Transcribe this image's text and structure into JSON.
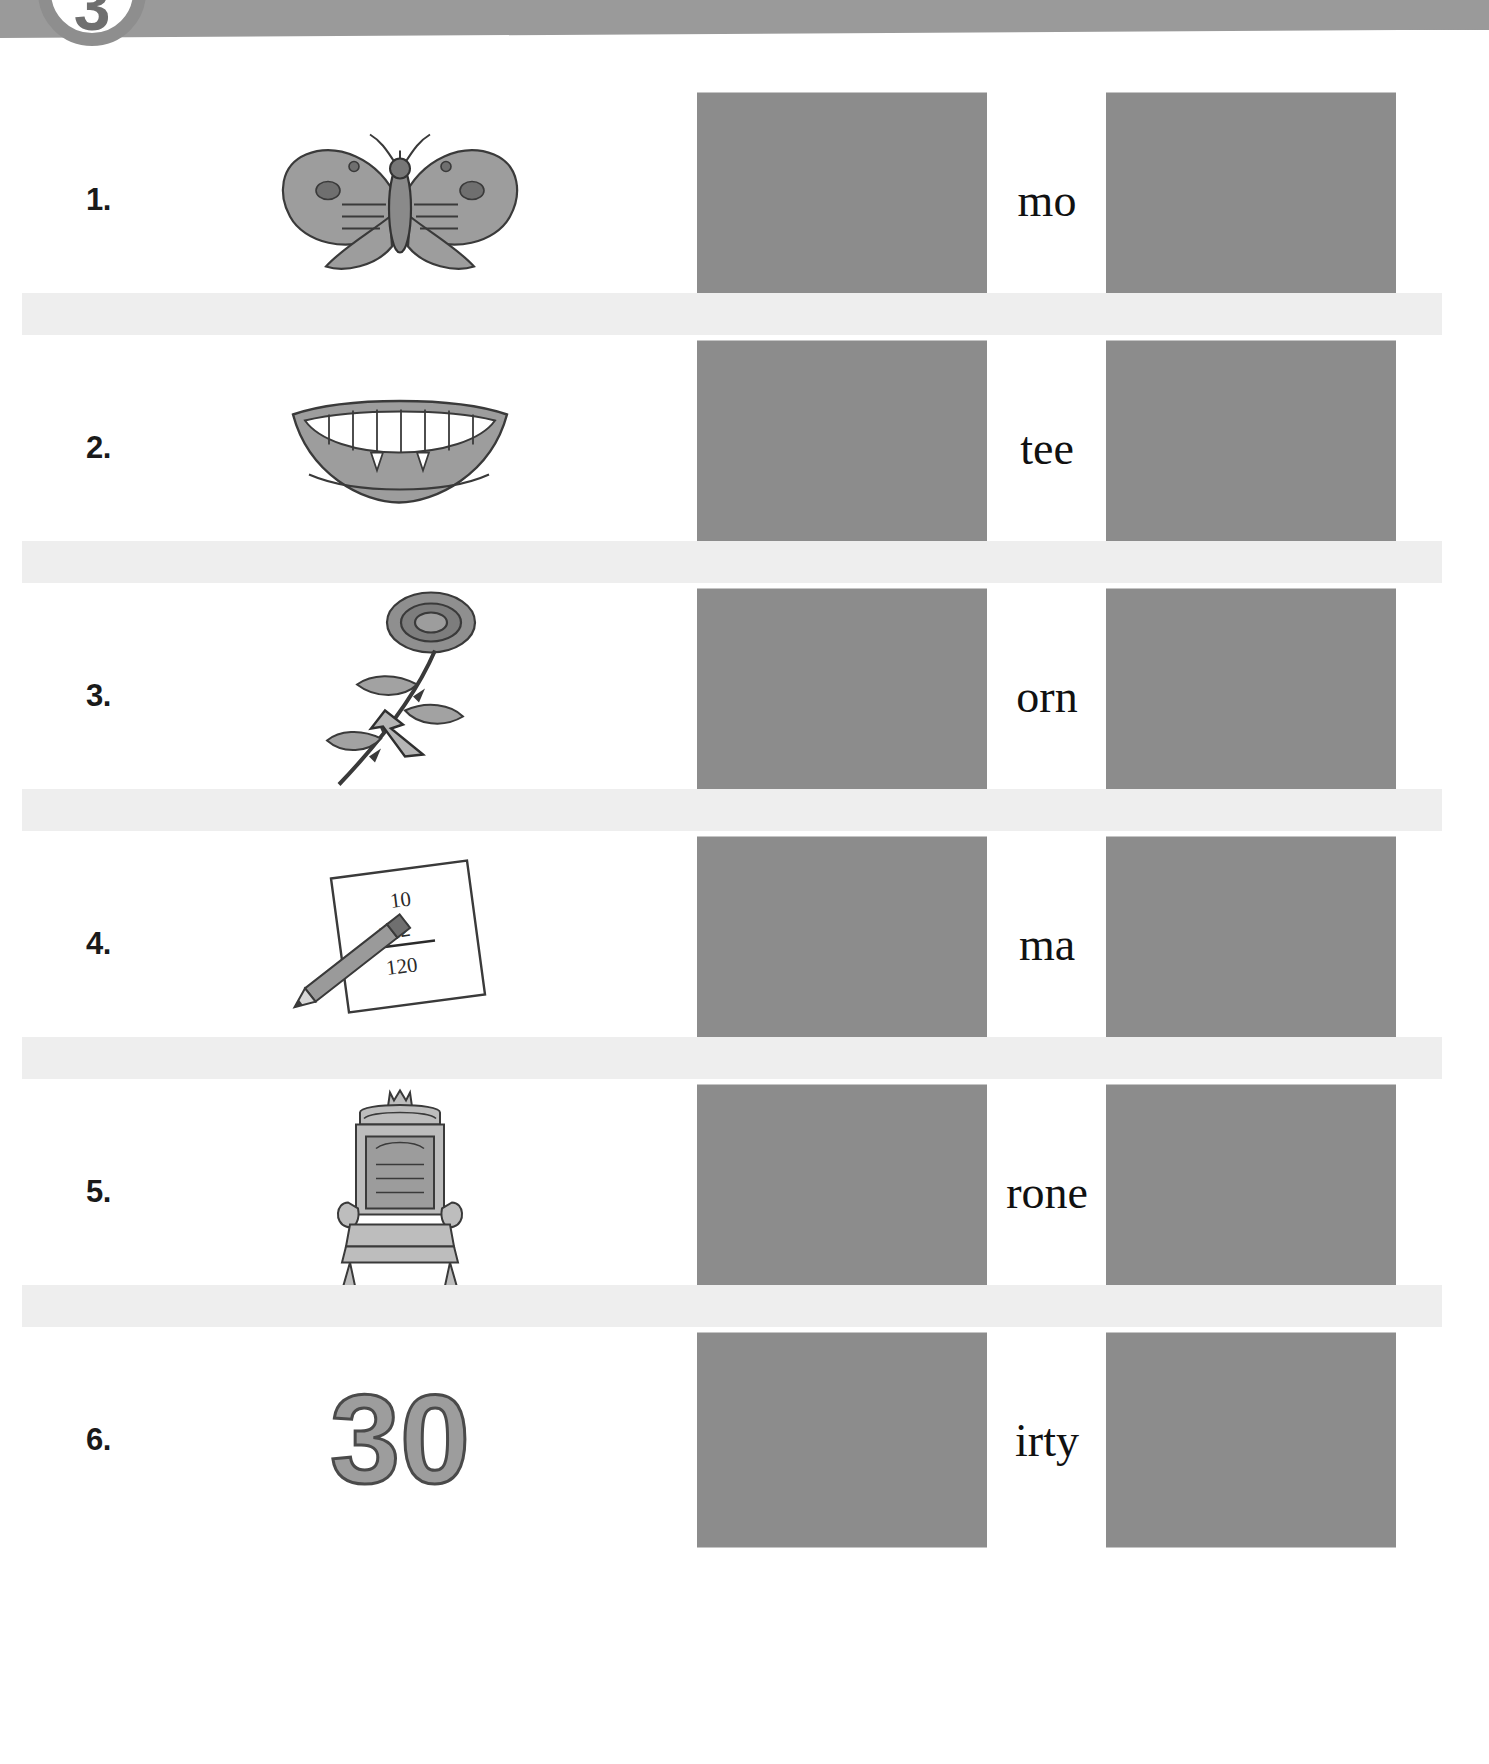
{
  "page": {
    "number": "3",
    "banner_color": "#9a9a9a",
    "answer_box_color": "#8c8c8c",
    "stripe_color": "#eeeeee"
  },
  "rows": [
    {
      "num": "1.",
      "word": "mo",
      "picture": "moth-illustration"
    },
    {
      "num": "2.",
      "word": "tee",
      "picture": "mouth-teeth-illustration"
    },
    {
      "num": "3.",
      "word": "orn",
      "picture": "rose-thorn-illustration"
    },
    {
      "num": "4.",
      "word": "ma",
      "picture": "math-paper-pencil-illustration"
    },
    {
      "num": "5.",
      "word": "rone",
      "picture": "throne-chair-illustration"
    },
    {
      "num": "6.",
      "word": "irty",
      "picture": "number-thirty-illustration"
    }
  ],
  "picture_details": {
    "math_paper": {
      "line1": "10",
      "line2": "×12",
      "line3": "120"
    },
    "thirty": {
      "numeral": "30"
    }
  }
}
